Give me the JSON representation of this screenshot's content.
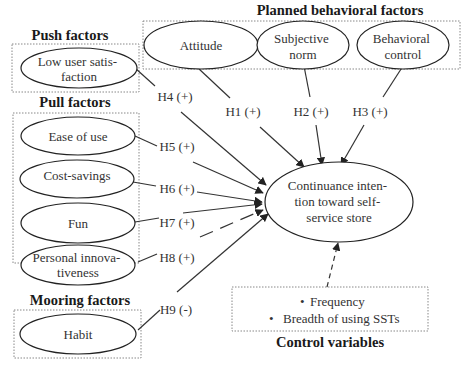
{
  "groups": {
    "planned": {
      "title": "Planned behavioral factors"
    },
    "push": {
      "title": "Push factors"
    },
    "pull": {
      "title": "Pull factors"
    },
    "mooring": {
      "title": "Mooring factors"
    },
    "control": {
      "title": "Control variables"
    }
  },
  "nodes": {
    "attitude": [
      "Attitude"
    ],
    "subjective_norm": [
      "Subjective",
      "norm"
    ],
    "behavioral_control": [
      "Behavioral",
      "control"
    ],
    "low_user_satisfaction": [
      "Low user satis-",
      "faction"
    ],
    "ease_of_use": [
      "Ease of use"
    ],
    "cost_savings": [
      "Cost-savings"
    ],
    "fun": [
      "Fun"
    ],
    "personal_innovativeness": [
      "Personal innova-",
      "tiveness"
    ],
    "habit": [
      "Habit"
    ],
    "continuance_intention": [
      "Continuance inten-",
      "tion toward self-",
      "service store"
    ]
  },
  "control_variables": {
    "bullet": "•",
    "items": [
      "Frequency",
      "Breadth of using SSTs"
    ]
  },
  "hypotheses": {
    "H1": "H1 (+)",
    "H2": "H2 (+)",
    "H3": "H3 (+)",
    "H4": "H4 (+)",
    "H5": "H5 (+)",
    "H6": "H6 (+)",
    "H7": "H7 (+)",
    "H8": "H8 (+)",
    "H9": "H9 (-)"
  }
}
